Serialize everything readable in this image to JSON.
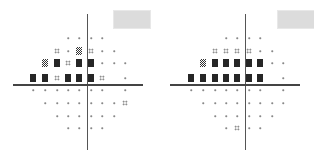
{
  "chart_data": {
    "type": "heatmap",
    "title": "",
    "legend": {
      "dot": "normal",
      "4dot": "mild depression",
      "checker": "moderate depression",
      "black": "severe depression"
    },
    "grid": {
      "columns_x": [
        33,
        45,
        57,
        68,
        79,
        91,
        102,
        114,
        125
      ],
      "rows_y": [
        38,
        51,
        63,
        78,
        90,
        103,
        116,
        128
      ]
    },
    "plots": [
      {
        "name": "left",
        "offset_x": 0,
        "axis_x": 87,
        "axis_y": 84,
        "box": {
          "x": 113,
          "y": 10,
          "w": 36,
          "h": 17
        },
        "rows": [
          [
            "",
            "",
            "",
            "dot",
            "dot",
            "dot",
            "dot",
            "",
            ""
          ],
          [
            "",
            "",
            "4dot",
            "dot",
            "checker",
            "4dot",
            "dot",
            "dot",
            ""
          ],
          [
            "",
            "checker",
            "black",
            "4dot",
            "black",
            "black",
            "dot",
            "dot",
            "dot"
          ],
          [
            "black",
            "black",
            "4dot",
            "black",
            "black",
            "black",
            "4dot",
            "",
            "dot"
          ],
          [
            "dot",
            "dot",
            "dot",
            "dot",
            "dot",
            "dot",
            "dot",
            "",
            "dot"
          ],
          [
            "",
            "dot",
            "dot",
            "dot",
            "dot",
            "dot",
            "dot",
            "dot",
            "4dot"
          ],
          [
            "",
            "",
            "dot",
            "dot",
            "dot",
            "dot",
            "dot",
            "dot",
            ""
          ],
          [
            "",
            "",
            "",
            "dot",
            "dot",
            "dot",
            "dot",
            "",
            ""
          ]
        ]
      },
      {
        "name": "right",
        "offset_x": 157,
        "axis_x": 88,
        "axis_y": 84,
        "box": {
          "x": 120,
          "y": 10,
          "w": 36,
          "h": 17
        },
        "rows": [
          [
            "",
            "",
            "",
            "dot",
            "dot",
            "dot",
            "dot",
            "",
            ""
          ],
          [
            "",
            "",
            "4dot",
            "4dot",
            "4dot",
            "4dot",
            "dot",
            "dot",
            ""
          ],
          [
            "",
            "checker",
            "black",
            "black",
            "black",
            "black",
            "black",
            "dot",
            "dot"
          ],
          [
            "black",
            "black",
            "black",
            "black",
            "black",
            "black",
            "black",
            "",
            "dot"
          ],
          [
            "dot",
            "dot",
            "dot",
            "dot",
            "dot",
            "dot",
            "dot",
            "",
            "dot"
          ],
          [
            "",
            "dot",
            "dot",
            "dot",
            "dot",
            "dot",
            "dot",
            "dot",
            "dot"
          ],
          [
            "",
            "",
            "dot",
            "dot",
            "dot",
            "dot",
            "dot",
            "dot",
            ""
          ],
          [
            "",
            "",
            "",
            "dot",
            "4dot",
            "dot",
            "dot",
            "",
            ""
          ]
        ]
      }
    ]
  }
}
